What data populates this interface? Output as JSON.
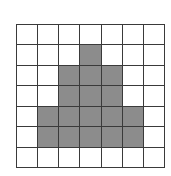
{
  "diagram": {
    "type": "grid",
    "rows": 7,
    "cols": 7,
    "colors": {
      "shaded": "#8c8c8c",
      "empty": "#ffffff",
      "line": "#3a3a3a"
    },
    "shaded_cells": [
      [
        1,
        3
      ],
      [
        2,
        2
      ],
      [
        2,
        3
      ],
      [
        2,
        4
      ],
      [
        3,
        2
      ],
      [
        3,
        3
      ],
      [
        3,
        4
      ],
      [
        4,
        1
      ],
      [
        4,
        2
      ],
      [
        4,
        3
      ],
      [
        4,
        4
      ],
      [
        4,
        5
      ],
      [
        5,
        1
      ],
      [
        5,
        2
      ],
      [
        5,
        3
      ],
      [
        5,
        4
      ],
      [
        5,
        5
      ]
    ]
  }
}
